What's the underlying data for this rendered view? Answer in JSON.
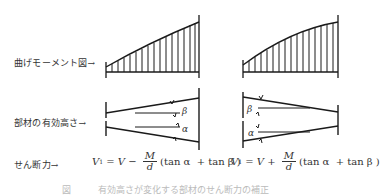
{
  "row_labels": {
    "moment": "曲げモーメント図→",
    "depth": "部材の有効高さ→",
    "shear": "せん断力→"
  },
  "left_case": {
    "angle_top": "β",
    "angle_bottom": "α",
    "formula": {
      "lhs": "V",
      "lhs_sub": "1",
      "eq": " = ",
      "v": "V",
      "sign": " − ",
      "num": "M",
      "den": "d",
      "tail": "(tan α  + tan β )"
    }
  },
  "right_case": {
    "angle_top": "β",
    "angle_bottom": "α",
    "formula": {
      "lhs": "V",
      "lhs_sub": "1",
      "eq": " = ",
      "v": "V",
      "sign": " + ",
      "num": "M",
      "den": "d",
      "tail": "(tan α  + tan β )"
    }
  },
  "caption": "図　　　有効高さが変化する部材のせん断力の補正",
  "colors": {
    "line": "#1a1a1a",
    "text": "#333333"
  }
}
